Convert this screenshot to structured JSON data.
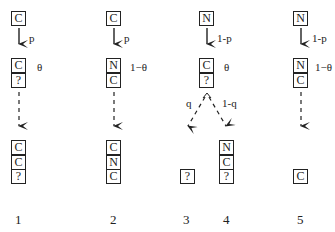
{
  "columns": [
    {
      "id": "1",
      "top_box": "C",
      "top_prob": "p",
      "mid_stack": [
        "C",
        "?"
      ],
      "mid_prob": "θ",
      "bottom_stack": [
        "C",
        "C",
        "?"
      ],
      "label": "1"
    },
    {
      "id": "2",
      "top_box": "C",
      "top_prob": "p",
      "mid_stack": [
        "N",
        "C"
      ],
      "mid_prob": "1−θ",
      "bottom_stack": [
        "C",
        "N",
        "C"
      ],
      "label": "2"
    },
    {
      "id": "3-4",
      "top_box": "N",
      "top_prob": "1-p",
      "mid_stack": [
        "C",
        "?"
      ],
      "mid_prob": "θ",
      "branch_left_prob": "q",
      "branch_right_prob": "1-q",
      "bottom_left_stack": [
        "?"
      ],
      "bottom_right_stack": [
        "N",
        "C",
        "?"
      ],
      "label_left": "3",
      "label_right": "4"
    },
    {
      "id": "5",
      "top_box": "N",
      "top_prob": "1-p",
      "mid_stack": [
        "N",
        "C"
      ],
      "mid_prob": "1−θ",
      "bottom_stack": [
        "C"
      ],
      "label": "5"
    }
  ]
}
